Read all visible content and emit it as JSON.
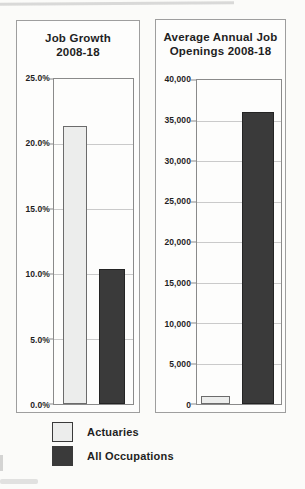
{
  "colors": {
    "actuaries_fill": "#ecedec",
    "all_occupations_fill": "#3a3a3a",
    "panel_border": "#9e9e9e",
    "axis_border": "#8a8a8a",
    "gridline": "#cacaca",
    "text": "#1f1f1f"
  },
  "legend": {
    "items": [
      {
        "label": "Actuaries",
        "color": "#ecedec"
      },
      {
        "label": "All Occupations",
        "color": "#3a3a3a"
      }
    ]
  },
  "chart_data": [
    {
      "type": "bar",
      "title": "Job Growth 2008-18",
      "title_lines": [
        "Job Growth",
        "2008-18"
      ],
      "categories": [
        "Actuaries",
        "All Occupations"
      ],
      "values": [
        21.4,
        10.4
      ],
      "value_format": "percent",
      "xlabel": "",
      "ylabel": "",
      "ylim": [
        0,
        25
      ],
      "ytick_step": 5,
      "yticks": [
        "25.0%",
        "20.0%",
        "15.0%",
        "10.0%",
        "5.0%",
        "0.0%"
      ],
      "grid": true,
      "legend_position": "below"
    },
    {
      "type": "bar",
      "title": "Average Annual Job Openings 2008-18",
      "title_lines": [
        "Average Annual Job",
        "Openings 2008-18"
      ],
      "categories": [
        "Actuaries",
        "All Occupations"
      ],
      "values": [
        1000,
        36000
      ],
      "value_format": "count",
      "xlabel": "",
      "ylabel": "",
      "ylim": [
        0,
        40000
      ],
      "ytick_step": 5000,
      "yticks": [
        "40,000",
        "35,000",
        "30,000",
        "25,000",
        "20,000",
        "15,000",
        "10,000",
        "5,000",
        "0"
      ],
      "grid": true,
      "legend_position": "below"
    }
  ]
}
